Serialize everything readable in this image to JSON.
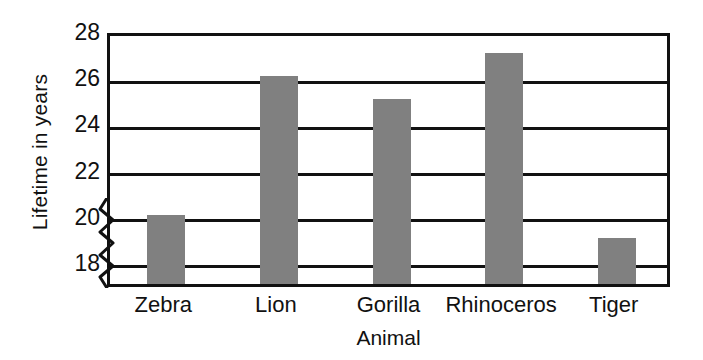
{
  "chart_data": {
    "type": "bar",
    "title": "",
    "categories": [
      "Zebra",
      "Lion",
      "Gorilla",
      "Rhinoceros",
      "Tiger"
    ],
    "values": [
      20,
      26,
      25,
      27,
      19
    ],
    "series": [
      {
        "name": "Lifetime in years",
        "values": [
          20,
          26,
          25,
          27,
          19
        ]
      }
    ],
    "xlabel": "Animal",
    "ylabel": "Lifetime in years",
    "ylim": [
      17,
      28
    ],
    "yticks": [
      18,
      20,
      22,
      24,
      26,
      28
    ],
    "ytick_labels": [
      "18",
      "20",
      "22",
      "24",
      "26",
      "28"
    ],
    "grid": true,
    "gridlines_horizontal": true,
    "legend": false,
    "legend_position": "none",
    "axis_break": true,
    "axis_break_note": "zigzag break on y-axis below 18",
    "bar_color": "#808080",
    "axis_color": "#111111",
    "background_color": "#ffffff"
  },
  "axes": {
    "y_title": "Lifetime in years",
    "x_title": "Animal"
  }
}
